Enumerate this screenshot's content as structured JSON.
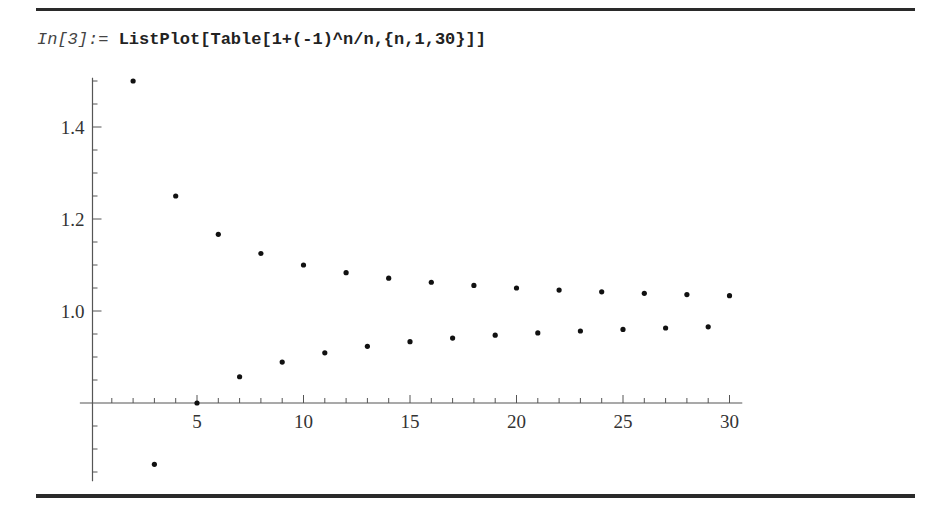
{
  "notebook": {
    "input_label": "In[3]:= ",
    "input_code": "ListPlot[Table[1+(-1)^n/n,{n,1,30}]]"
  },
  "colors": {
    "rule": "#2a2a2a",
    "axis": "#555555",
    "point": "#111111",
    "text": "#333333"
  },
  "chart_data": {
    "type": "scatter",
    "title": "",
    "xlabel": "",
    "ylabel": "",
    "x": [
      1,
      2,
      3,
      4,
      5,
      6,
      7,
      8,
      9,
      10,
      11,
      12,
      13,
      14,
      15,
      16,
      17,
      18,
      19,
      20,
      21,
      22,
      23,
      24,
      25,
      26,
      27,
      28,
      29,
      30
    ],
    "values": [
      0.0,
      1.5,
      0.6667,
      1.25,
      0.8,
      1.1667,
      0.8571,
      1.125,
      0.8889,
      1.1,
      0.9091,
      1.0833,
      0.9231,
      1.0714,
      0.9333,
      1.0625,
      0.9412,
      1.0556,
      0.9474,
      1.05,
      0.9524,
      1.0455,
      0.9565,
      1.0417,
      0.96,
      1.0385,
      0.963,
      1.0357,
      0.9655,
      1.0333
    ],
    "xlim": [
      -0.5,
      30.6
    ],
    "ylim": [
      0.63,
      1.507
    ],
    "axes_origin": [
      0,
      0.8
    ],
    "x_ticks": [
      5,
      10,
      15,
      20,
      25,
      30
    ],
    "x_tick_labels": [
      "5",
      "10",
      "15",
      "20",
      "25",
      "30"
    ],
    "x_minor_step": 1,
    "y_ticks": [
      1.0,
      1.2,
      1.4
    ],
    "y_tick_labels": [
      "1.0",
      "1.2",
      "1.4"
    ],
    "y_minor_step": 0.05,
    "grid": false,
    "legend": null,
    "note": "Point n=1 (value 0) lies outside the plotted range and is not visible"
  }
}
